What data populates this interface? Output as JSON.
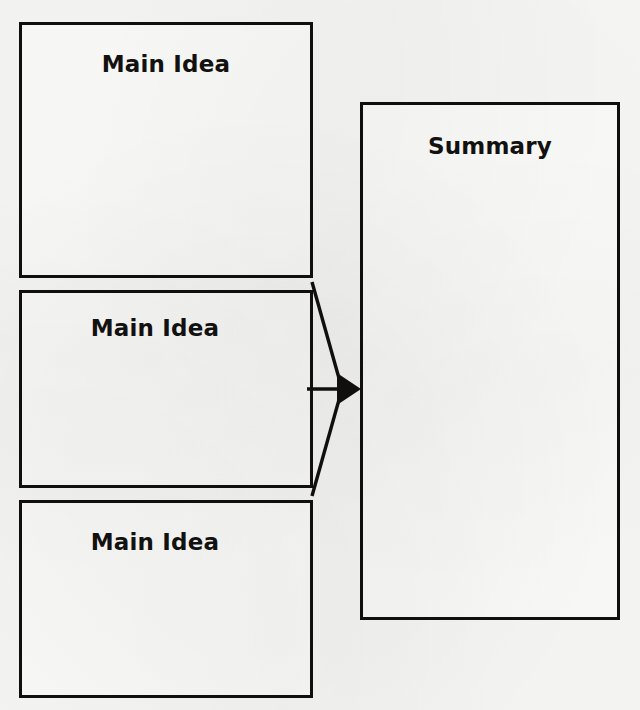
{
  "diagram": {
    "background_color": "#f7f7f5",
    "line_color": "#100f0d",
    "text_color": "#121110",
    "box_fill": "#fbfbfa"
  },
  "boxes": [
    {
      "id": "main-idea-1",
      "label": "Main Idea"
    },
    {
      "id": "main-idea-2",
      "label": "Main Idea"
    },
    {
      "id": "main-idea-3",
      "label": "Main Idea"
    },
    {
      "id": "summary",
      "label": "Summary"
    }
  ],
  "connectors": {
    "kind": "three-to-one-converging-arrow",
    "arrow_count": 1,
    "description": "Lines from the right edges of the three Main Idea boxes converge into a single arrowhead pointing at the Summary box",
    "sources": [
      "main-idea-1",
      "main-idea-2",
      "main-idea-3"
    ],
    "target": "summary"
  }
}
